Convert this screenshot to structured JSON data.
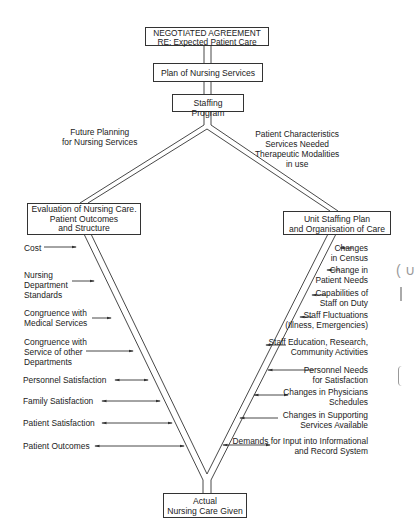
{
  "boxes": {
    "top": [
      "NEGOTIATED AGREEMENT",
      "RE: Expected Patient Care"
    ],
    "plan": "Plan of Nursing Services",
    "staffing": "Staffing Program",
    "evaluation": [
      "Evaluation of Nursing Care.",
      "Patient Outcomes",
      "and Structure"
    ],
    "unit": [
      "Unit Staffing Plan",
      "and Organisation of Care"
    ],
    "actual": [
      "Actual",
      "Nursing Care Given"
    ]
  },
  "branch_labels": {
    "left": [
      "Future Planning",
      "for Nursing Services"
    ],
    "right": [
      "Patient Characteristics",
      "Services Needed",
      "Therapeutic Modalities",
      "in use"
    ]
  },
  "left_factors": [
    {
      "lines": [
        "Cost"
      ],
      "arrow": "right"
    },
    {
      "lines": [
        "Nursing",
        "Department",
        "Standards"
      ],
      "arrow": "right"
    },
    {
      "lines": [
        "Congruence with",
        "Medical Services"
      ],
      "arrow": "right"
    },
    {
      "lines": [
        "Congruence with",
        "Service of other",
        "Departments"
      ],
      "arrow": "right"
    },
    {
      "lines": [
        "Personnel Satisfaction"
      ],
      "arrow": "both"
    },
    {
      "lines": [
        "Family Satisfaction"
      ],
      "arrow": "both"
    },
    {
      "lines": [
        "Patient Satisfaction"
      ],
      "arrow": "both"
    },
    {
      "lines": [
        "Patient Outcomes"
      ],
      "arrow": "both"
    }
  ],
  "right_factors": [
    {
      "lines": [
        "Changes",
        "in Census"
      ],
      "arrow": "left"
    },
    {
      "lines": [
        "Change in",
        "Patient Needs"
      ],
      "arrow": "left"
    },
    {
      "lines": [
        "Capabilities of",
        "Staff on Duty"
      ],
      "arrow": "left"
    },
    {
      "lines": [
        "Staff Fluctuations",
        "(Illness, Emergencies)"
      ],
      "arrow": "left"
    },
    {
      "lines": [
        "Staff Education, Research,",
        "Community Activities"
      ],
      "arrow": "left"
    },
    {
      "lines": [
        "Personnel Needs",
        "for Satisfaction"
      ],
      "arrow": "left"
    },
    {
      "lines": [
        "Changes in Physicians",
        "Schedules"
      ],
      "arrow": "both"
    },
    {
      "lines": [
        "Changes in Supporting",
        "Services Available"
      ],
      "arrow": "left"
    },
    {
      "lines": [
        "Demands for Input into Informational",
        "and Record System"
      ],
      "arrow": "both"
    }
  ]
}
